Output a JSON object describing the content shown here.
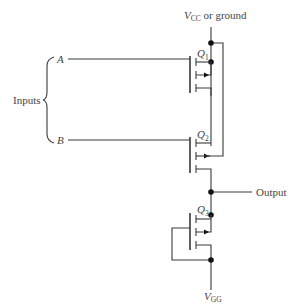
{
  "diagram": {
    "type": "circuit-schematic",
    "supply_top": {
      "main": "V",
      "sub": "CC",
      "suffix": " or ground"
    },
    "supply_bottom": {
      "main": "V",
      "sub": "GG"
    },
    "output_label": "Output",
    "inputs_label": "Inputs",
    "inputs": [
      {
        "name": "A"
      },
      {
        "name": "B"
      }
    ],
    "transistors": [
      {
        "main": "Q",
        "sub": "1"
      },
      {
        "main": "Q",
        "sub": "2"
      },
      {
        "main": "Q",
        "sub": "3"
      }
    ]
  }
}
